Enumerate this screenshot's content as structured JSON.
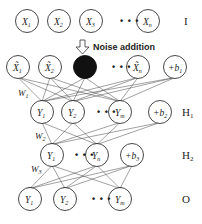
{
  "diagram": {
    "layers": [
      {
        "id": "I",
        "label": "I",
        "y": 21,
        "nodes": [
          {
            "x": 27,
            "label": "X",
            "sub": "1"
          },
          {
            "x": 59,
            "label": "X",
            "sub": "2"
          },
          {
            "x": 91,
            "label": "X",
            "sub": "3"
          },
          {
            "x": 148,
            "label": "X",
            "sub": "n"
          }
        ],
        "dots_x": 120
      },
      {
        "id": "noisy",
        "label": "",
        "y": 67,
        "nodes": [
          {
            "x": 18,
            "label": "X̃",
            "sub": "1"
          },
          {
            "x": 50,
            "label": "X̃",
            "sub": "2"
          },
          {
            "x": 85,
            "label": "",
            "sub": "",
            "black": true
          },
          {
            "x": 138,
            "label": "X̃",
            "sub": "n"
          },
          {
            "x": 175,
            "label": "+b",
            "sub": "1",
            "bias": true
          }
        ],
        "dots_x": 112
      },
      {
        "id": "H1",
        "label": "H1",
        "y": 112,
        "nodes": [
          {
            "x": 42,
            "label": "Y",
            "sub": "1"
          },
          {
            "x": 73,
            "label": "Y",
            "sub": "2"
          },
          {
            "x": 120,
            "label": "Y",
            "sub": "m"
          },
          {
            "x": 160,
            "label": "+b",
            "sub": "2",
            "bias": true
          }
        ],
        "dots_x": 97
      },
      {
        "id": "H2",
        "label": "H2",
        "y": 155,
        "nodes": [
          {
            "x": 52,
            "label": "Y",
            "sub": "1"
          },
          {
            "x": 97,
            "label": "Y",
            "sub": "n"
          },
          {
            "x": 132,
            "label": "+b",
            "sub": "3",
            "bias": true
          }
        ],
        "dots_x": 75
      },
      {
        "id": "O",
        "label": "O",
        "y": 199,
        "nodes": [
          {
            "x": 30,
            "label": "Y",
            "sub": "1"
          },
          {
            "x": 65,
            "label": "Y",
            "sub": "2"
          },
          {
            "x": 120,
            "label": "Y",
            "sub": "m"
          }
        ],
        "dots_x": 92
      }
    ],
    "annotations": {
      "noise_addition": "Noise addition",
      "weights": [
        {
          "label": "W",
          "sub": "1",
          "x": 18,
          "y": 96
        },
        {
          "label": "W",
          "sub": "2",
          "x": 35,
          "y": 139
        },
        {
          "label": "W",
          "sub": "3",
          "x": 31,
          "y": 172
        }
      ]
    },
    "layer_labels": {
      "I": "I",
      "H1": "H",
      "H1_sub": "1",
      "H2": "H",
      "H2_sub": "2",
      "O": "O"
    }
  }
}
